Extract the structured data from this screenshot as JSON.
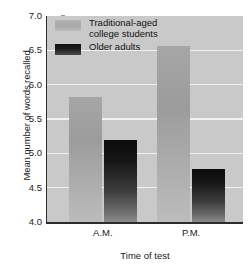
{
  "chart_data": {
    "type": "bar",
    "title": "",
    "xlabel": "Time of test",
    "ylabel": "Mean number of words recalled",
    "categories": [
      "A.M.",
      "P.M."
    ],
    "ylim": [
      4.0,
      7.0
    ],
    "yticks": [
      "4.0",
      "4.5",
      "5.0",
      "5.5",
      "6.0",
      "6.5",
      "7.0"
    ],
    "ytick_values": [
      4.0,
      4.5,
      5.0,
      5.5,
      6.0,
      6.5,
      7.0
    ],
    "grid": true,
    "legend_position": "top-left",
    "series": [
      {
        "name": "Traditional-aged\ncollege students",
        "color": "#a0a0a0",
        "values": [
          5.82,
          6.57
        ]
      },
      {
        "name": "Older adults",
        "color": "#151515",
        "values": [
          5.19,
          4.77
        ]
      }
    ]
  },
  "axis": {
    "y_title": "Mean number of words recalled",
    "x_title": "Time of test"
  },
  "colors": {
    "plot_background": "#c9c9c9",
    "gridline": "#f2f2f2",
    "axis": "#2c2c2c",
    "series_light": "#a0a0a0",
    "series_dark": "#151515"
  }
}
